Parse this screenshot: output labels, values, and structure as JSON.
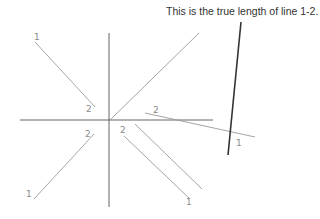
{
  "caption": "This is the true length of line 1-2.",
  "colors": {
    "axis": "#555555",
    "projection_line": "#9a9a9a",
    "true_length_line": "#333333",
    "label": "#8a8a8a"
  },
  "axes": {
    "vertical": {
      "x1": 109,
      "y1": 33,
      "x2": 109,
      "y2": 207
    },
    "horizontal": {
      "x1": 20,
      "y1": 120,
      "x2": 213,
      "y2": 120
    }
  },
  "lines": [
    {
      "name": "projection-nw",
      "x1": 35,
      "y1": 42,
      "x2": 95,
      "y2": 107
    },
    {
      "name": "projection-ne",
      "x1": 110,
      "y1": 120,
      "x2": 199,
      "y2": 33
    },
    {
      "name": "projection-east",
      "x1": 145,
      "y1": 113,
      "x2": 255,
      "y2": 137
    },
    {
      "name": "projection-sw",
      "x1": 34,
      "y1": 199,
      "x2": 94,
      "y2": 134
    },
    {
      "name": "projection-se-a",
      "x1": 124,
      "y1": 136,
      "x2": 190,
      "y2": 199
    },
    {
      "name": "projection-se-b",
      "x1": 135,
      "y1": 124,
      "x2": 202,
      "y2": 189
    }
  ],
  "true_length_line": {
    "x1": 241,
    "y1": 22,
    "x2": 228,
    "y2": 155
  },
  "labels": [
    {
      "text": "1",
      "x": 34,
      "y": 40
    },
    {
      "text": "2",
      "x": 86,
      "y": 112
    },
    {
      "text": "2",
      "x": 153,
      "y": 113
    },
    {
      "text": "1",
      "x": 236,
      "y": 146
    },
    {
      "text": "2",
      "x": 85,
      "y": 137
    },
    {
      "text": "1",
      "x": 26,
      "y": 197
    },
    {
      "text": "2",
      "x": 120,
      "y": 133
    },
    {
      "text": "1",
      "x": 186,
      "y": 205
    }
  ]
}
